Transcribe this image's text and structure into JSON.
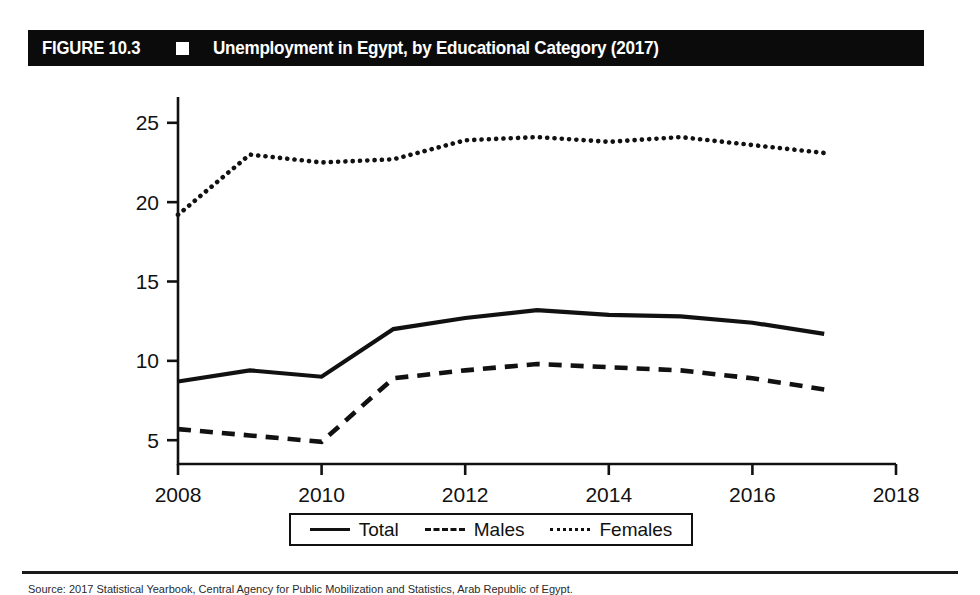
{
  "figure": {
    "number_label": "FIGURE 10.3",
    "separator_icon": "white-square",
    "title": "Unemployment in Egypt, by Educational Category (2017)"
  },
  "footer": {
    "source_text": "Source: 2017 Statistical Yearbook, Central Agency for Public Mobilization and Statistics, Arab Republic of Egypt."
  },
  "legend": {
    "items": [
      {
        "label": "Total",
        "style": "solid"
      },
      {
        "label": "Males",
        "style": "dashed"
      },
      {
        "label": "Females",
        "style": "dotted"
      }
    ]
  },
  "chart_data": {
    "type": "line",
    "title": "Unemployment in Egypt, by Educational Category (2017)",
    "xlabel": "",
    "ylabel": "",
    "xlim": [
      2008,
      2018
    ],
    "ylim": [
      3.5,
      26.5
    ],
    "xticks": [
      2008,
      2010,
      2012,
      2014,
      2016,
      2018
    ],
    "xtick_labels": [
      "2008",
      "2010",
      "2012",
      "2014",
      "2016",
      "2018"
    ],
    "yticks": [
      5,
      10,
      15,
      20,
      25
    ],
    "ytick_labels": [
      "5",
      "10",
      "15",
      "20",
      "25"
    ],
    "grid": false,
    "legend_position": "bottom-center",
    "x": [
      2008,
      2009,
      2010,
      2011,
      2012,
      2013,
      2014,
      2015,
      2016,
      2017
    ],
    "series": [
      {
        "name": "Total",
        "style": "solid",
        "values": [
          8.7,
          9.4,
          9.0,
          12.0,
          12.7,
          13.2,
          12.9,
          12.8,
          12.4,
          11.7
        ]
      },
      {
        "name": "Males",
        "style": "dashed",
        "values": [
          5.7,
          5.3,
          4.9,
          8.9,
          9.4,
          9.8,
          9.6,
          9.4,
          8.9,
          8.2
        ]
      },
      {
        "name": "Females",
        "style": "dotted",
        "values": [
          19.2,
          23.0,
          22.5,
          22.7,
          23.9,
          24.1,
          23.8,
          24.1,
          23.6,
          23.1
        ]
      }
    ]
  }
}
